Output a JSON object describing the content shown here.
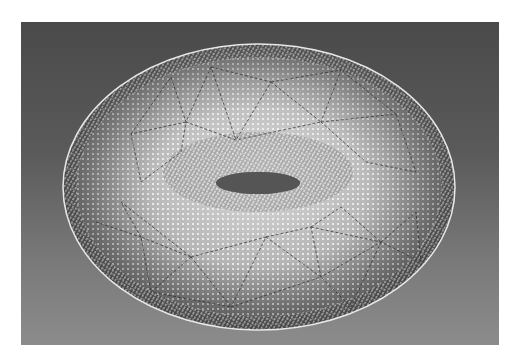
{
  "figure": {
    "colors": {
      "background_top": "#4a4a4a",
      "background_bottom": "#8c8c8c",
      "surface_light": "#d8d8d8",
      "surface_dark": "#6a6a6a",
      "points": "#f2f2f2",
      "mesh_lines": "#2e2e2e",
      "hole": "#555555"
    }
  },
  "caption": {
    "text": ""
  }
}
